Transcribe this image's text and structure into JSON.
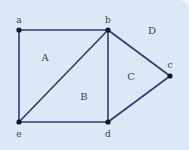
{
  "diagram": {
    "type": "planar-graph",
    "colors": {
      "background": "#dbe8f5",
      "edge": "#2b3c6e",
      "node": "#111827",
      "label": "#3a3f4a"
    },
    "vertices": [
      {
        "id": "a",
        "label": "a",
        "x": 19,
        "y": 30,
        "lx": 19,
        "ly": 20
      },
      {
        "id": "b",
        "label": "b",
        "x": 108,
        "y": 30,
        "lx": 108,
        "ly": 20
      },
      {
        "id": "c",
        "label": "c",
        "x": 170,
        "y": 76,
        "lx": 170,
        "ly": 65
      },
      {
        "id": "d",
        "label": "d",
        "x": 108,
        "y": 122,
        "lx": 108,
        "ly": 134
      },
      {
        "id": "e",
        "label": "e",
        "x": 19,
        "y": 122,
        "lx": 19,
        "ly": 134
      }
    ],
    "edges": [
      [
        "a",
        "b"
      ],
      [
        "a",
        "e"
      ],
      [
        "b",
        "e"
      ],
      [
        "b",
        "d"
      ],
      [
        "b",
        "c"
      ],
      [
        "c",
        "d"
      ],
      [
        "e",
        "d"
      ]
    ],
    "regions": [
      {
        "label": "A",
        "x": 45,
        "y": 57
      },
      {
        "label": "B",
        "x": 84,
        "y": 96
      },
      {
        "label": "C",
        "x": 131,
        "y": 76
      },
      {
        "label": "D",
        "x": 152,
        "y": 30
      }
    ]
  }
}
